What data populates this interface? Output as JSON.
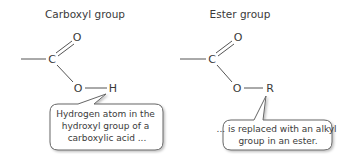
{
  "carboxyl": {
    "title": "Carboxyl group",
    "atoms": {
      "carbon": "C",
      "oxygen_double": "O",
      "oxygen_single": "O",
      "hydrogen": "H"
    },
    "callout": [
      "Hydrogen atom in the",
      "hydroxyl group of a",
      "carboxylic acid ..."
    ]
  },
  "ester": {
    "title": "Ester group",
    "atoms": {
      "carbon": "C",
      "oxygen_double": "O",
      "oxygen_single": "O",
      "r_group": "R"
    },
    "callout": [
      "... is replaced with an alkyl",
      "group in an ester."
    ]
  }
}
